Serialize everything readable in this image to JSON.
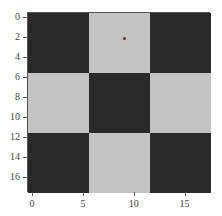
{
  "chart_data": {
    "type": "heatmap",
    "title": "",
    "xlabel": "",
    "ylabel": "",
    "xlim": [
      -0.5,
      17.5
    ],
    "ylim": [
      17.5,
      -0.5
    ],
    "grid": false,
    "colormap": "gray",
    "blocks": [
      [
        0,
        1,
        0
      ],
      [
        1,
        0,
        1
      ],
      [
        0,
        1,
        0
      ]
    ],
    "block_size": 6,
    "colors": {
      "dark": "#2a2a2a",
      "light": "#c4c4c4"
    },
    "xticks": [
      "0",
      "5",
      "10",
      "15"
    ],
    "xtick_values": [
      0,
      5,
      10,
      15
    ],
    "yticks": [
      "0",
      "2",
      "4",
      "6",
      "8",
      "10",
      "12",
      "14",
      "16"
    ],
    "ytick_values": [
      0,
      2,
      4,
      6,
      8,
      10,
      12,
      14,
      16
    ],
    "annotations": [
      {
        "type": "point",
        "x": 9,
        "y": 2,
        "color": "#7a2a2a"
      }
    ]
  }
}
